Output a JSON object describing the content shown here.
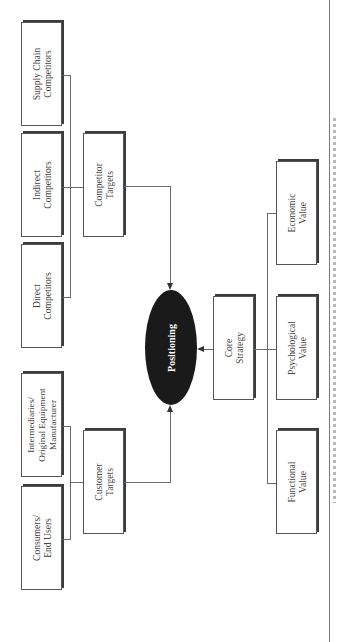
{
  "diagram": {
    "center": {
      "label": "Positioning",
      "fill": "#1a1a1a",
      "text_color": "#ffffff"
    },
    "competitor_branch": {
      "group_label": "Competitor\nTargets",
      "items": [
        {
          "label": "Supply Chain\nCompetitors"
        },
        {
          "label": "Indirect\nCompetitors"
        },
        {
          "label": "Direct\nCompetitors"
        }
      ]
    },
    "customer_branch": {
      "group_label": "Customer\nTargets",
      "items": [
        {
          "label": "Intermediaries/\nOriginal Equipment\nManufacturer"
        },
        {
          "label": "Consumers/\nEnd Users"
        }
      ]
    },
    "strategy_branch": {
      "group_label": "Core\nStrategy",
      "items": [
        {
          "label": "Economic\nValue"
        },
        {
          "label": "Psychological\nValue"
        },
        {
          "label": "Functional\nValue"
        }
      ]
    },
    "edges": [
      {
        "from": "Competitor Targets",
        "to": "Positioning"
      },
      {
        "from": "Customer Targets",
        "to": "Positioning"
      },
      {
        "from": "Core Strategy",
        "to": "Positioning"
      }
    ],
    "orientation": "rotated 90° counter-clockwise"
  }
}
